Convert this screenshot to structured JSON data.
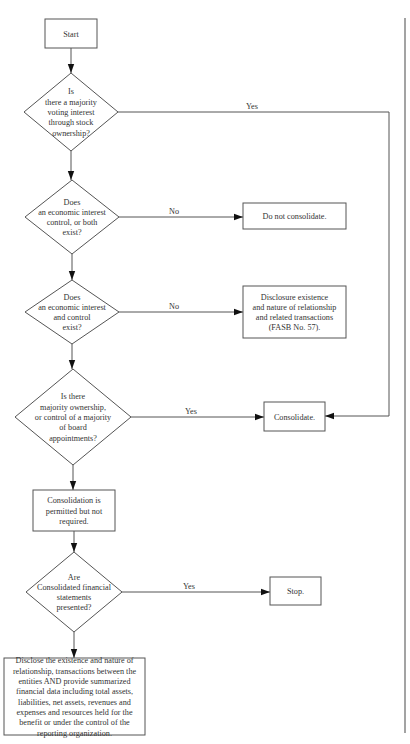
{
  "diagram": {
    "type": "flowchart",
    "nodes": [
      {
        "id": "start",
        "kind": "box",
        "lines": [
          "Start"
        ]
      },
      {
        "id": "q1",
        "kind": "decision",
        "lines": [
          "Is",
          "there a majority",
          "voting interest",
          "through stock",
          "ownership?"
        ]
      },
      {
        "id": "q2",
        "kind": "decision",
        "lines": [
          "Does",
          "an economic interest",
          "control, or both",
          "exist?"
        ]
      },
      {
        "id": "do-not-consolidate",
        "kind": "box",
        "lines": [
          "Do not consolidate."
        ]
      },
      {
        "id": "q3",
        "kind": "decision",
        "lines": [
          "Does",
          "an economic interest",
          "and control",
          "exist?"
        ]
      },
      {
        "id": "disclosure",
        "kind": "box",
        "lines": [
          "Disclosure existence",
          "and nature of relationship",
          "and related transactions",
          "(FASB No. 57)."
        ]
      },
      {
        "id": "q4",
        "kind": "decision",
        "lines": [
          "Is there",
          "majority ownership,",
          "or control of a majority",
          "of board",
          "appointments?"
        ]
      },
      {
        "id": "consolidate",
        "kind": "box",
        "lines": [
          "Consolidate."
        ]
      },
      {
        "id": "permitted",
        "kind": "box",
        "lines": [
          "Consolidation is",
          "permitted but not",
          "required."
        ]
      },
      {
        "id": "q5",
        "kind": "decision",
        "lines": [
          "Are",
          "Consolidated financial",
          "statements",
          "presented?"
        ]
      },
      {
        "id": "stop",
        "kind": "box",
        "lines": [
          "Stop."
        ]
      },
      {
        "id": "disclose-full",
        "kind": "box",
        "lines": [
          "Disclose the existence and nature of",
          "relationship, transactions between the",
          "entities AND provide summarized",
          "financial data including total assets,",
          "liabilities, net assets, revenues and",
          "expenses and resources held for the",
          "benefit or under the control of the",
          "reporting organization."
        ]
      }
    ],
    "edges": [
      {
        "from": "start",
        "to": "q1",
        "label": ""
      },
      {
        "from": "q1",
        "to": "consolidate",
        "label": "Yes"
      },
      {
        "from": "q1",
        "to": "q2",
        "label": ""
      },
      {
        "from": "q2",
        "to": "do-not-consolidate",
        "label": "No"
      },
      {
        "from": "q2",
        "to": "q3",
        "label": ""
      },
      {
        "from": "q3",
        "to": "disclosure",
        "label": "No"
      },
      {
        "from": "q3",
        "to": "q4",
        "label": ""
      },
      {
        "from": "q4",
        "to": "consolidate",
        "label": "Yes"
      },
      {
        "from": "q4",
        "to": "permitted",
        "label": ""
      },
      {
        "from": "permitted",
        "to": "q5",
        "label": ""
      },
      {
        "from": "q5",
        "to": "stop",
        "label": "Yes"
      },
      {
        "from": "q5",
        "to": "disclose-full",
        "label": ""
      }
    ]
  },
  "colors": {
    "stroke": "#555555",
    "arrowhead": "#111111",
    "text": "#333333",
    "background": "#ffffff"
  }
}
